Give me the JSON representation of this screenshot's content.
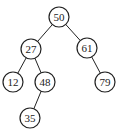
{
  "diagram": {
    "type": "binary-search-tree",
    "node_radius": 10,
    "stroke_color": "#222222",
    "fill_color": "#ffffff",
    "nodes": [
      {
        "id": "n50",
        "label": "50",
        "x": 59,
        "y": 17
      },
      {
        "id": "n27",
        "label": "27",
        "x": 31,
        "y": 49
      },
      {
        "id": "n61",
        "label": "61",
        "x": 87,
        "y": 48
      },
      {
        "id": "n12",
        "label": "12",
        "x": 13,
        "y": 82
      },
      {
        "id": "n48",
        "label": "48",
        "x": 45,
        "y": 82
      },
      {
        "id": "n79",
        "label": "79",
        "x": 105,
        "y": 82
      },
      {
        "id": "n35",
        "label": "35",
        "x": 30,
        "y": 118
      }
    ],
    "edges": [
      {
        "from": "n50",
        "to": "n27"
      },
      {
        "from": "n50",
        "to": "n61"
      },
      {
        "from": "n27",
        "to": "n12"
      },
      {
        "from": "n27",
        "to": "n48"
      },
      {
        "from": "n61",
        "to": "n79"
      },
      {
        "from": "n48",
        "to": "n35"
      }
    ]
  }
}
